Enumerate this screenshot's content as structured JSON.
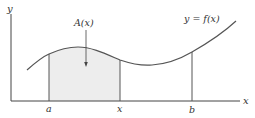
{
  "diagram": {
    "type": "area-under-curve",
    "colors": {
      "axis": "#444444",
      "curve": "#555555",
      "shade": "#ededed",
      "text": "#333333"
    },
    "labels": {
      "y_axis": "y",
      "x_axis": "x",
      "curve": "y = f(x)",
      "area": "A(x)",
      "tick_a": "a",
      "tick_x": "x",
      "tick_b": "b"
    }
  }
}
